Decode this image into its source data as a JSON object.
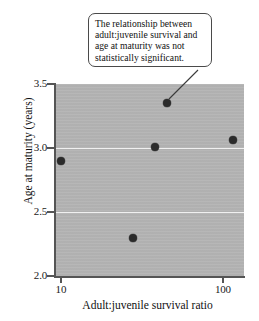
{
  "callout": {
    "text": "The relationship between adult:juvenile survival and age at maturity was not statistically significant."
  },
  "chart_data": {
    "type": "scatter",
    "title": "",
    "xlabel": "Adult:juvenile survival ratio",
    "ylabel": "Age at maturity (years)",
    "x_scale": "log",
    "y_scale": "linear",
    "xlim": [
      9.2,
      135
    ],
    "ylim": [
      2.0,
      3.5
    ],
    "x_ticks": [
      "10",
      "100"
    ],
    "x_tick_values": [
      10,
      100
    ],
    "y_ticks": [
      "3.5",
      "3.0",
      "2.5",
      "2.0"
    ],
    "y_tick_values": [
      3.5,
      3.0,
      2.5,
      2.0
    ],
    "gridlines": {
      "horizontal_at": [
        3.0,
        2.5
      ],
      "color": "#f0f0f0"
    },
    "plot_background": "#b4b4b4",
    "marker_color": "#2b2b2b",
    "points": [
      {
        "x": 10.0,
        "y": 2.9
      },
      {
        "x": 28.0,
        "y": 2.3
      },
      {
        "x": 38.0,
        "y": 3.01
      },
      {
        "x": 45.0,
        "y": 3.35
      },
      {
        "x": 115.0,
        "y": 3.06
      }
    ],
    "annotation": {
      "text": "The relationship between adult:juvenile survival and age at maturity was not statistically significant.",
      "points_to": {
        "x": 45.0,
        "y": 3.35
      }
    }
  }
}
